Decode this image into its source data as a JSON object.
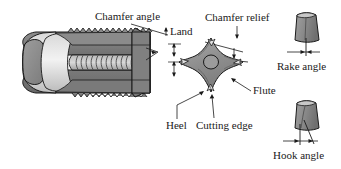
{
  "figure": {
    "background_color": "#ffffff",
    "line_color": "#1a1a1a",
    "metal_fill_dark": "#7d7d7d",
    "metal_fill_mid": "#9a9a9a",
    "metal_fill_light": "#cfcfcf",
    "metal_fill_highlight": "#e8e8e8"
  },
  "labels": {
    "chamfer_angle": "Chamfer angle",
    "land": "Land",
    "chamfer_relief": "Chamfer relief",
    "flute": "Flute",
    "heel": "Heel",
    "cutting_edge": "Cutting edge",
    "rake_angle": "Rake angle",
    "hook_angle": "Hook angle"
  },
  "parts": {
    "tap_body": "tap-body-isometric",
    "cross_section": "tap-cross-section-four-flute",
    "rake_inset": "rake-angle-detail",
    "hook_inset": "hook-angle-detail"
  }
}
